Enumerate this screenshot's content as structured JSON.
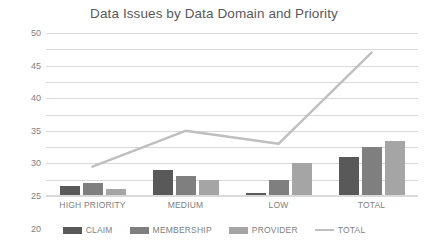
{
  "chart_data": {
    "type": "bar",
    "title": "Data Issues by Data Domain and Priority",
    "xlabel": "",
    "ylabel": "",
    "ylim": [
      0,
      50
    ],
    "ytick_step": 5,
    "yticks": [
      "0",
      "5",
      "10",
      "15",
      "20",
      "25",
      "30",
      "35",
      "40",
      "45",
      "50"
    ],
    "grid": true,
    "legend_position": "bottom",
    "categories": [
      "HIGH PRIORITY",
      "MEDIUM",
      "LOW",
      "TOTAL"
    ],
    "series": [
      {
        "name": "CLAIM",
        "type": "bar",
        "color": "#595959",
        "values": [
          3,
          8,
          1,
          12
        ]
      },
      {
        "name": "MEMBERSHIP",
        "type": "bar",
        "color": "#7f7f7f",
        "values": [
          4,
          6,
          5,
          15
        ]
      },
      {
        "name": "PROVIDER",
        "type": "bar",
        "color": "#a5a5a5",
        "values": [
          2,
          5,
          10,
          17
        ]
      },
      {
        "name": "TOTAL",
        "type": "line",
        "color": "#bfbfbf",
        "values": [
          9,
          20,
          16,
          44
        ]
      }
    ]
  },
  "colors": {
    "claim": "#595959",
    "membership": "#7f7f7f",
    "provider": "#a5a5a5",
    "total_line": "#bfbfbf",
    "gridline": "#d9d9d9",
    "text": "#595959",
    "tick_text": "#808080",
    "background": "#ffffff"
  }
}
